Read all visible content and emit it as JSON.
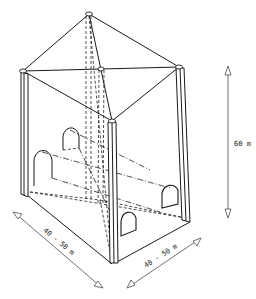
{
  "diagram": {
    "caption_fragment": "",
    "dimensions": {
      "height_label": "60 m",
      "width_left_label": "40 - 50 m",
      "width_right_label": "40 - 50 m"
    },
    "components": [
      {
        "name": "pyramidal roof",
        "style": "solid"
      },
      {
        "name": "corner pillars",
        "count": 4
      },
      {
        "name": "access tunnels",
        "count": 2,
        "profile": "arched"
      },
      {
        "name": "hidden edges",
        "style": "dashed"
      }
    ],
    "colors": {
      "line": "#1a1a1a",
      "background": "#ffffff"
    }
  }
}
